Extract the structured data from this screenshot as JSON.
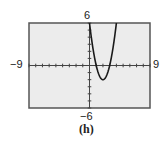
{
  "figure": {
    "caption": "(h)"
  },
  "window": {
    "xmin_label": "−9",
    "xmax_label": "9",
    "ymin_label": "−6",
    "ymax_label": "6"
  },
  "colors": {
    "background": "#ececec",
    "frame": "#555555",
    "axis": "#444444",
    "curve": "#1a1a1a"
  },
  "chart_data": {
    "type": "line",
    "title": "(h)",
    "xlabel": "",
    "ylabel": "",
    "xlim": [
      -9,
      9
    ],
    "ylim": [
      -6,
      6
    ],
    "xscale": 1,
    "yscale": 1,
    "grid": false,
    "axes_ticks": true,
    "series": [
      {
        "name": "y = 2x^2 - 8x + 6",
        "x": [
          0,
          0.5,
          1,
          1.5,
          2,
          2.5,
          3,
          3.5,
          4
        ],
        "y": [
          6,
          2.5,
          0,
          -1.5,
          -2,
          -1.5,
          0,
          2.5,
          6
        ]
      }
    ],
    "annotations": {
      "x_intercepts": [
        1,
        3
      ],
      "vertex": [
        2,
        -2
      ],
      "y_intercept": 6
    }
  }
}
